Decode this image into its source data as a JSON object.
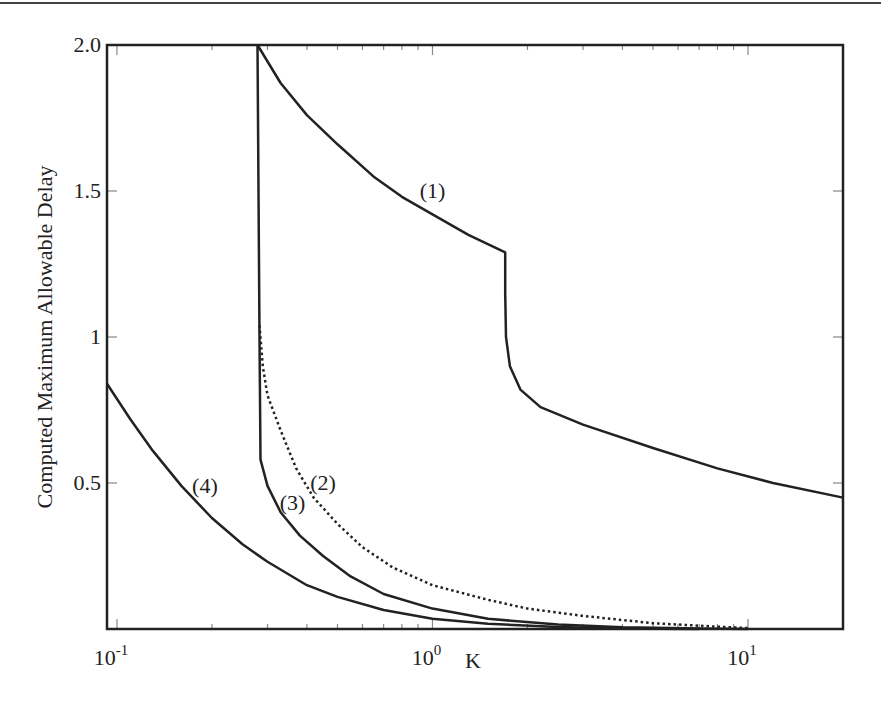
{
  "chart_data": {
    "type": "line",
    "title": "",
    "xlabel": "K",
    "ylabel": "Computed Maximum Allowable Delay",
    "xscale": "log",
    "xlim": [
      0.093,
      20
    ],
    "ylim": [
      0,
      2.0
    ],
    "x_tick_labels": [
      {
        "base": "10",
        "exp": "-1",
        "value": 0.1
      },
      {
        "base": "10",
        "exp": "0",
        "value": 1
      },
      {
        "base": "10",
        "exp": "1",
        "value": 10
      }
    ],
    "y_tick_labels": [
      {
        "label": "0.5",
        "value": 0.5
      },
      {
        "label": "1",
        "value": 1.0
      },
      {
        "label": "1.5",
        "value": 1.5
      },
      {
        "label": "2.0",
        "value": 2.0
      }
    ],
    "grid": false,
    "legend": "none (inline curve labels)",
    "series": [
      {
        "name": "(1)",
        "style": "solid",
        "points": [
          [
            0.279,
            2.0
          ],
          [
            0.33,
            1.87
          ],
          [
            0.4,
            1.76
          ],
          [
            0.5,
            1.66
          ],
          [
            0.65,
            1.55
          ],
          [
            0.8,
            1.48
          ],
          [
            1.0,
            1.42
          ],
          [
            1.3,
            1.35
          ],
          [
            1.7,
            1.29
          ],
          [
            1.7,
            1.15
          ],
          [
            1.71,
            1.0
          ],
          [
            1.76,
            0.9
          ],
          [
            1.9,
            0.82
          ],
          [
            2.2,
            0.76
          ],
          [
            3.0,
            0.7
          ],
          [
            5.0,
            0.62
          ],
          [
            8.0,
            0.55
          ],
          [
            12.0,
            0.5
          ],
          [
            20.0,
            0.45
          ]
        ]
      },
      {
        "name": "(2)",
        "style": "dotted",
        "points": [
          [
            0.283,
            1.04
          ],
          [
            0.29,
            0.9
          ],
          [
            0.3,
            0.8
          ],
          [
            0.33,
            0.68
          ],
          [
            0.37,
            0.55
          ],
          [
            0.42,
            0.45
          ],
          [
            0.5,
            0.36
          ],
          [
            0.6,
            0.28
          ],
          [
            0.75,
            0.21
          ],
          [
            1.0,
            0.15
          ],
          [
            1.5,
            0.1
          ],
          [
            2.0,
            0.07
          ],
          [
            3.0,
            0.045
          ],
          [
            5.0,
            0.02
          ],
          [
            8.0,
            0.008
          ],
          [
            10.0,
            0.003
          ]
        ]
      },
      {
        "name": "(3)",
        "style": "solid",
        "points": [
          [
            0.279,
            2.0
          ],
          [
            0.281,
            1.5
          ],
          [
            0.283,
            1.0
          ],
          [
            0.285,
            0.58
          ],
          [
            0.3,
            0.49
          ],
          [
            0.33,
            0.4
          ],
          [
            0.38,
            0.32
          ],
          [
            0.45,
            0.25
          ],
          [
            0.55,
            0.18
          ],
          [
            0.7,
            0.12
          ],
          [
            1.0,
            0.07
          ],
          [
            1.5,
            0.035
          ],
          [
            2.5,
            0.015
          ],
          [
            4.0,
            0.006
          ],
          [
            7.0,
            0.002
          ],
          [
            10.0,
            0.0
          ]
        ]
      },
      {
        "name": "(4)",
        "style": "solid",
        "points": [
          [
            0.093,
            0.84
          ],
          [
            0.11,
            0.72
          ],
          [
            0.13,
            0.61
          ],
          [
            0.16,
            0.49
          ],
          [
            0.2,
            0.38
          ],
          [
            0.25,
            0.29
          ],
          [
            0.3,
            0.23
          ],
          [
            0.4,
            0.15
          ],
          [
            0.5,
            0.11
          ],
          [
            0.7,
            0.065
          ],
          [
            1.0,
            0.035
          ],
          [
            1.5,
            0.018
          ],
          [
            2.5,
            0.007
          ],
          [
            4.0,
            0.002
          ],
          [
            7.0,
            0.0
          ]
        ]
      }
    ],
    "annotations": [
      {
        "text": "(1)",
        "x": 1.0,
        "y": 1.5
      },
      {
        "text": "(2)",
        "x": 0.45,
        "y": 0.5
      },
      {
        "text": "(3)",
        "x": 0.36,
        "y": 0.43
      },
      {
        "text": "(4)",
        "x": 0.19,
        "y": 0.49
      }
    ]
  },
  "plot_area": {
    "left": 107,
    "right": 843,
    "top": 45,
    "bottom": 629
  },
  "colors": {
    "axis": "#222222",
    "line": "#222222",
    "tick": "#888888",
    "background": "#ffffff"
  }
}
